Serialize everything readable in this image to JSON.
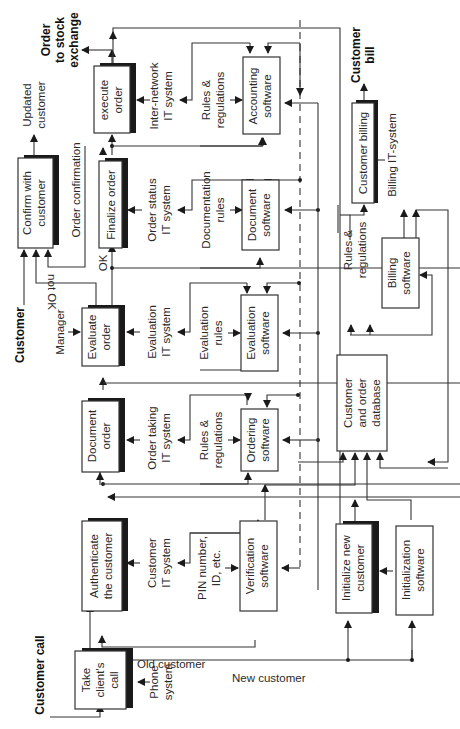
{
  "diagram": {
    "orientation": "rotated 90 degrees counter-clockwise",
    "external_labels": {
      "customer_call": "Customer call",
      "customer": "Customer",
      "order_to_stock_exchange_1": "Order",
      "order_to_stock_exchange_2": "to stock",
      "order_to_stock_exchange_3": "exchange",
      "customer_bill_1": "Customer",
      "customer_bill_2": "bill",
      "updated_customer_1": "Updated",
      "updated_customer_2": "customer"
    },
    "process_boxes": {
      "take_call": [
        "Take",
        "client's",
        "call"
      ],
      "authenticate": [
        "Authenticate",
        "the customer"
      ],
      "document_order": [
        "Document",
        "order"
      ],
      "evaluate_order": [
        "Evaluate",
        "order"
      ],
      "finalize_order": [
        "Finalize order"
      ],
      "confirm_customer": [
        "Confirm with",
        "customer"
      ],
      "execute_order": [
        "execute",
        "order"
      ],
      "initialize_customer": [
        "Initialize new",
        "customer"
      ],
      "customer_billing": [
        "Customer billing"
      ]
    },
    "software_boxes": {
      "verification": [
        "Verification",
        "software"
      ],
      "ordering": [
        "Ordering",
        "software"
      ],
      "evaluation": [
        "Evaluation",
        "software"
      ],
      "document_sw": [
        "Document",
        "software"
      ],
      "accounting": [
        "Accounting",
        "software"
      ],
      "initialization": [
        "Initialization",
        "software"
      ],
      "billing": [
        "Billing",
        "software"
      ],
      "database": [
        "Customer",
        "and order",
        "database"
      ]
    },
    "mechanism_labels": {
      "phone_system": [
        "Phone",
        "system"
      ],
      "customer_it": [
        "Customer",
        "IT system"
      ],
      "pin": [
        "PIN number,",
        "ID, etc."
      ],
      "order_taking_it": [
        "Order taking",
        "IT system"
      ],
      "rules_reg_1": [
        "Rules &",
        "regulations"
      ],
      "manager": [
        "Manager"
      ],
      "evaluation_it": [
        "Evaluation",
        "IT system"
      ],
      "evaluation_rules": [
        "Evaluation",
        "rules"
      ],
      "order_status_it": [
        "Order status",
        "IT system"
      ],
      "documentation_rules": [
        "Documentation",
        "rules"
      ],
      "inter_network_it": [
        "Inter-network",
        "IT system"
      ],
      "rules_reg_2": [
        "Rules &",
        "regulations"
      ],
      "rules_reg_3": [
        "Rules &",
        "regulations"
      ],
      "billing_it": [
        "Billing IT-system"
      ]
    },
    "flow_labels": {
      "old_customer": "Old customer",
      "new_customer": "New customer",
      "ok": "OK",
      "not_ok": "not OK",
      "order_confirmation": "Order confirmation"
    }
  }
}
